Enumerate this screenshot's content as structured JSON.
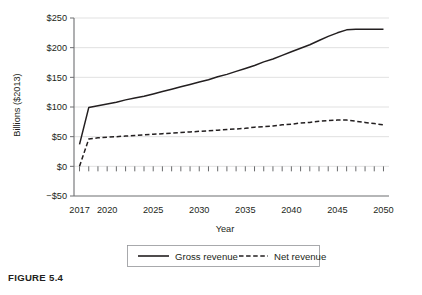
{
  "caption": "FIGURE 5.4",
  "chart_data": {
    "type": "line",
    "title": "",
    "xlabel": "Year",
    "ylabel": "Billions ($2013)",
    "xlim": [
      2016.4,
      2050.6
    ],
    "ylim": [
      -50,
      250
    ],
    "xticks": [
      2017,
      2020,
      2025,
      2030,
      2035,
      2040,
      2045,
      2050
    ],
    "xtick_labels": [
      "2017",
      "2020",
      "2025",
      "2030",
      "2035",
      "2040",
      "2045",
      "2050"
    ],
    "yticks": [
      -50,
      0,
      50,
      100,
      150,
      200,
      250
    ],
    "ytick_labels": [
      "−$50",
      "$0",
      "$50",
      "$100",
      "$150",
      "$200",
      "$250"
    ],
    "grid": "horizontal",
    "minor_xticks_every": 1,
    "minor_tick_baseline": 0,
    "legend_position": "below-axis",
    "x": [
      2017,
      2018,
      2019,
      2020,
      2021,
      2022,
      2023,
      2024,
      2025,
      2026,
      2027,
      2028,
      2029,
      2030,
      2031,
      2032,
      2033,
      2034,
      2035,
      2036,
      2037,
      2038,
      2039,
      2040,
      2041,
      2042,
      2043,
      2044,
      2045,
      2046,
      2047,
      2048,
      2049,
      2050
    ],
    "series": [
      {
        "name": "Gross revenue",
        "style": "solid",
        "color": "#231f20",
        "values": [
          37,
          99,
          102,
          105,
          108,
          112,
          115,
          118,
          122,
          126,
          130,
          134,
          138,
          142,
          146,
          151,
          155,
          160,
          165,
          170,
          176,
          181,
          187,
          193,
          199,
          205,
          212,
          219,
          225,
          230,
          231,
          231,
          231,
          231
        ]
      },
      {
        "name": "Net revenue",
        "style": "dashed",
        "color": "#231f20",
        "values": [
          0,
          46,
          48,
          49,
          50,
          51,
          52,
          53,
          54,
          55,
          56,
          57,
          58,
          59,
          60,
          61,
          62,
          63,
          64,
          66,
          67,
          68,
          70,
          71,
          73,
          74,
          76,
          77,
          78,
          78,
          76,
          74,
          72,
          70
        ]
      }
    ]
  },
  "legend": {
    "items": [
      {
        "label": "Gross revenue",
        "style": "solid"
      },
      {
        "label": "Net revenue",
        "style": "dashed"
      }
    ]
  }
}
